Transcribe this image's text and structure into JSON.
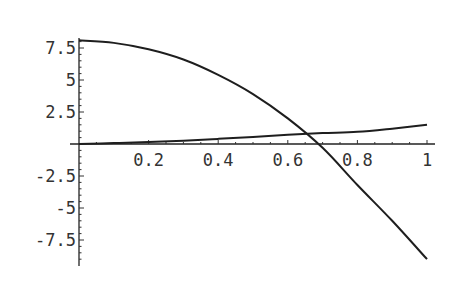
{
  "chart_data": {
    "type": "line",
    "title": "",
    "xlabel": "",
    "ylabel": "",
    "xlim": [
      0,
      1
    ],
    "ylim": [
      -9.2,
      8.2
    ],
    "grid": false,
    "legend": null,
    "x_ticks": [
      0.2,
      0.4,
      0.6,
      0.8,
      1
    ],
    "x_tick_labels": [
      "0.2",
      "0.4",
      "0.6",
      "0.8",
      "1"
    ],
    "y_ticks": [
      7.5,
      5,
      2.5,
      -2.5,
      -5,
      -7.5
    ],
    "y_tick_labels": [
      "7.5",
      "5",
      "2.5",
      "-2.5",
      "-5",
      "-7.5"
    ],
    "x": [
      0,
      0.1,
      0.2,
      0.3,
      0.4,
      0.5,
      0.6,
      0.7,
      0.8,
      0.9,
      1.0
    ],
    "series": [
      {
        "name": "decreasing curve",
        "values": [
          8.1,
          7.9,
          7.4,
          6.6,
          5.4,
          3.9,
          2.0,
          -0.3,
          -3.2,
          -6.0,
          -9.0
        ]
      },
      {
        "name": "increasing curve",
        "values": [
          0.0,
          0.07,
          0.15,
          0.26,
          0.4,
          0.55,
          0.72,
          0.85,
          0.95,
          1.2,
          1.5
        ]
      }
    ],
    "annotations": []
  }
}
